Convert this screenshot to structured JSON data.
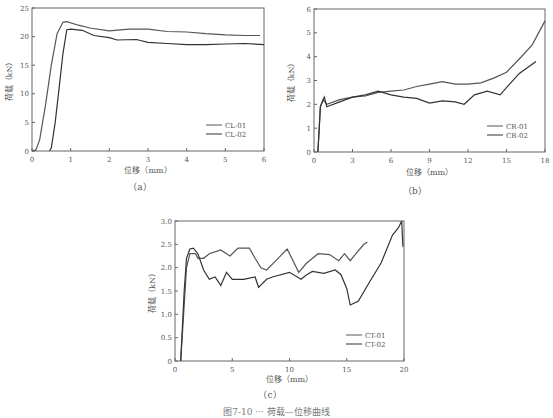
{
  "figure_caption": "图7-10 ··· 荷载—位移曲线",
  "chart_data": [
    {
      "id": "a",
      "type": "line",
      "panel_label": "（a）",
      "xlabel": "位移（mm）",
      "ylabel": "荷载（kN）",
      "xlim": [
        0,
        6
      ],
      "ylim": [
        0,
        25
      ],
      "xticks": [
        0,
        1,
        2,
        3,
        4,
        5,
        6
      ],
      "yticks": [
        0,
        5,
        10,
        15,
        20,
        25
      ],
      "legend": [
        "CL-01",
        "CL-02"
      ],
      "legend_position": "lower right",
      "series": [
        {
          "name": "CL-01",
          "x": [
            0,
            0.1,
            0.2,
            0.35,
            0.5,
            0.65,
            0.8,
            0.9,
            1.2,
            1.5,
            2.0,
            2.5,
            3.0,
            3.5,
            4.0,
            4.5,
            5.0,
            5.5,
            5.9
          ],
          "y": [
            0,
            0.2,
            2,
            8,
            15,
            20.5,
            22.5,
            22.6,
            22,
            21.5,
            21,
            21.3,
            21.3,
            20.9,
            20.8,
            20.5,
            20.3,
            20.2,
            20.2
          ]
        },
        {
          "name": "CL-02",
          "x": [
            0.45,
            0.5,
            0.6,
            0.7,
            0.8,
            0.9,
            1.0,
            1.3,
            1.6,
            2.0,
            2.2,
            2.7,
            3.0,
            3.5,
            4.0,
            4.5,
            5.0,
            5.5,
            6.0
          ],
          "y": [
            0,
            0.5,
            5,
            11,
            17,
            21.2,
            21.3,
            21.1,
            20.2,
            19.8,
            19.4,
            19.5,
            19.0,
            18.8,
            18.6,
            18.6,
            18.7,
            18.8,
            18.6
          ]
        }
      ]
    },
    {
      "id": "b",
      "type": "line",
      "panel_label": "（b）",
      "xlabel": "位移（mm）",
      "ylabel": "荷载（kN）",
      "xlim": [
        0,
        18
      ],
      "ylim": [
        0,
        6
      ],
      "xticks": [
        0,
        3,
        6,
        9,
        12,
        15,
        18
      ],
      "yticks": [
        0,
        1,
        2,
        3,
        4,
        5,
        6
      ],
      "legend": [
        "CR-01",
        "CR-02"
      ],
      "legend_position": "lower right",
      "series": [
        {
          "name": "CR-01",
          "x": [
            0.3,
            0.5,
            0.7,
            1,
            2,
            3,
            4,
            5,
            6,
            7,
            8,
            9,
            10,
            11,
            12,
            13,
            14,
            15,
            16,
            17,
            18
          ],
          "y": [
            0,
            1.9,
            2.2,
            2.0,
            2.2,
            2.3,
            2.35,
            2.5,
            2.55,
            2.6,
            2.75,
            2.85,
            2.95,
            2.85,
            2.85,
            2.9,
            3.1,
            3.35,
            3.9,
            4.5,
            5.5
          ]
        },
        {
          "name": "CR-02",
          "x": [
            0.3,
            0.5,
            0.8,
            1,
            2,
            3,
            4,
            5,
            6,
            7,
            8,
            9,
            10,
            11,
            11.7,
            12.5,
            13.5,
            14.5,
            15,
            16,
            17.3
          ],
          "y": [
            0,
            1.9,
            2.3,
            1.9,
            2.1,
            2.3,
            2.4,
            2.55,
            2.4,
            2.3,
            2.25,
            2.05,
            2.15,
            2.1,
            2.0,
            2.4,
            2.55,
            2.4,
            2.7,
            3.3,
            3.8
          ]
        }
      ]
    },
    {
      "id": "c",
      "type": "line",
      "panel_label": "（c）",
      "xlabel": "位移（mm）",
      "ylabel": "荷载（kN）",
      "xlim": [
        0,
        20
      ],
      "ylim": [
        0,
        3.0
      ],
      "xticks": [
        0,
        5,
        10,
        15,
        20
      ],
      "yticks": [
        0,
        0.5,
        1.0,
        1.5,
        2.0,
        2.5,
        3.0
      ],
      "ytick_labels": [
        "0",
        "0.5",
        "1.0",
        "1.5",
        "2.0",
        "2.5",
        "3.0"
      ],
      "legend": [
        "CT-01",
        "CT-02"
      ],
      "legend_position": "lower right",
      "series": [
        {
          "name": "CT-01",
          "x": [
            0.5,
            0.8,
            1.0,
            1.3,
            1.8,
            2.0,
            2.5,
            3,
            4,
            4.8,
            5.5,
            6.5,
            7,
            7.5,
            8,
            9,
            9.8,
            10.2,
            10.8,
            11.5,
            12.5,
            13.5,
            14.3,
            14.8,
            15.3,
            15.8,
            16.5,
            16.8
          ],
          "y": [
            0,
            1.2,
            2.0,
            2.3,
            2.3,
            2.2,
            2.2,
            2.3,
            2.38,
            2.25,
            2.42,
            2.42,
            2.2,
            2.0,
            1.95,
            2.2,
            2.4,
            2.2,
            1.9,
            2.1,
            2.3,
            2.28,
            2.15,
            2.3,
            2.15,
            2.3,
            2.5,
            2.55
          ]
        },
        {
          "name": "CT-02",
          "x": [
            0.5,
            0.8,
            1.0,
            1.3,
            1.6,
            2.0,
            2.5,
            3,
            3.5,
            4,
            4.5,
            5,
            6,
            7,
            7.3,
            8,
            8.5,
            10,
            11,
            11.5,
            12,
            13,
            14,
            14.5,
            15,
            15.3,
            16,
            17,
            18,
            19,
            19.5,
            19.8,
            19.9
          ],
          "y": [
            0,
            1.5,
            2.2,
            2.4,
            2.42,
            2.3,
            1.95,
            1.75,
            1.8,
            1.62,
            1.9,
            1.75,
            1.75,
            1.8,
            1.58,
            1.75,
            1.8,
            1.9,
            1.75,
            1.85,
            1.92,
            1.88,
            1.95,
            1.85,
            1.55,
            1.2,
            1.28,
            1.7,
            2.1,
            2.7,
            2.85,
            3.0,
            2.45
          ]
        }
      ]
    }
  ]
}
